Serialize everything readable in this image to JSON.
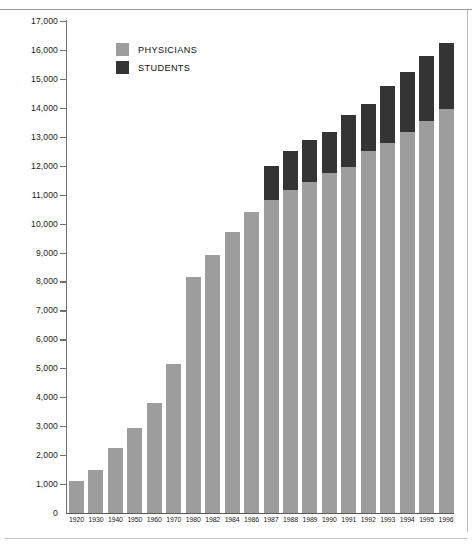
{
  "colors": {
    "physicians": "#9d9d9d",
    "students": "#343434",
    "axis": "#5a5a5a",
    "text": "#1b1b1b",
    "background": "#ffffff"
  },
  "legend": {
    "position": "top-left-inside",
    "items": [
      {
        "label": "PHYSICIANS",
        "color": "#9d9d9d"
      },
      {
        "label": "STUDENTS",
        "color": "#343434"
      }
    ]
  },
  "axis": {
    "y_ticks": [
      "0",
      "1,000",
      "2,000",
      "3,000",
      "4,000",
      "5,000",
      "6,000",
      "7,000",
      "8,000",
      "9,000",
      "10,000",
      "11,000",
      "12,000",
      "13,000",
      "14,000",
      "15,000",
      "16,000",
      "17,000"
    ],
    "x_ticks": [
      "1920",
      "1930",
      "1940",
      "1950",
      "1960",
      "1970",
      "1980",
      "1982",
      "1984",
      "1986",
      "1987",
      "1988",
      "1989",
      "1990",
      "1991",
      "1992",
      "1993",
      "1994",
      "1995",
      "1996"
    ]
  },
  "chart_data": {
    "type": "bar",
    "stacked": true,
    "title": "",
    "subtitle": "",
    "xlabel": "",
    "ylabel": "",
    "ylim": [
      0,
      17000
    ],
    "ytick_step": 1000,
    "grid": false,
    "legend_position": "top-left-inside",
    "categories": [
      "1920",
      "1930",
      "1940",
      "1950",
      "1960",
      "1970",
      "1980",
      "1982",
      "1984",
      "1986",
      "1987",
      "1988",
      "1989",
      "1990",
      "1991",
      "1992",
      "1993",
      "1994",
      "1995",
      "1996"
    ],
    "series": [
      {
        "name": "PHYSICIANS",
        "color": "#9d9d9d",
        "values": [
          1100,
          1500,
          2250,
          2950,
          3800,
          5150,
          8150,
          8900,
          9700,
          10400,
          10800,
          11150,
          11450,
          11750,
          11950,
          12500,
          12800,
          13150,
          13550,
          13950
        ]
      },
      {
        "name": "STUDENTS",
        "color": "#343434",
        "values": [
          0,
          0,
          0,
          0,
          0,
          0,
          0,
          0,
          0,
          0,
          1200,
          1350,
          1450,
          1400,
          1800,
          1650,
          1950,
          2100,
          2250,
          2300
        ]
      }
    ],
    "totals": [
      1100,
      1500,
      2250,
      2950,
      3800,
      5150,
      8150,
      8900,
      9700,
      10400,
      12000,
      12500,
      12900,
      13150,
      13750,
      14150,
      14750,
      15250,
      15800,
      16250
    ]
  }
}
